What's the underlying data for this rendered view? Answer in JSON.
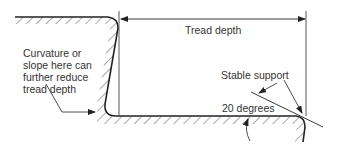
{
  "diagram": {
    "labels": {
      "tread_depth": "Tread depth",
      "curvature_note_line1": "Curvature or",
      "curvature_note_line2": "slope here can",
      "curvature_note_line3": "further reduce",
      "curvature_note_line4": "tread depth",
      "stable_support": "Stable support",
      "angle": "20 degrees"
    },
    "colors": {
      "line": "#222222",
      "hatch": "#555555",
      "text": "#333333",
      "background": "#ffffff"
    }
  }
}
